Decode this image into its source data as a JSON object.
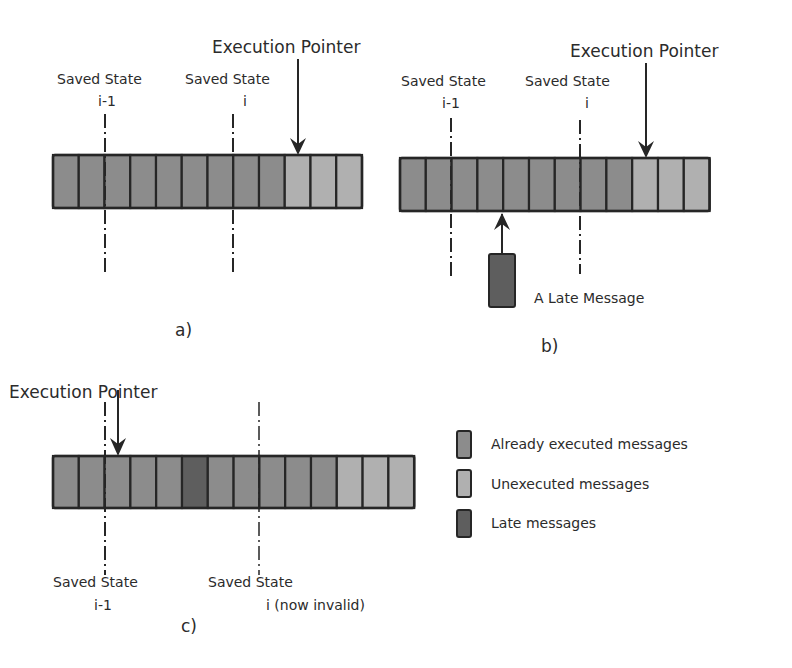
{
  "colors": {
    "executed": "#8c8c8c",
    "unexecuted": "#b0b0b0",
    "late": "#5e5e5e",
    "stroke": "#262626",
    "text": "#2b2b2b"
  },
  "panels": [
    {
      "id": "a",
      "label": "a)",
      "cells": [
        "executed",
        "executed",
        "executed",
        "executed",
        "executed",
        "executed",
        "executed",
        "executed",
        "executed",
        "unexecuted",
        "unexecuted",
        "unexecuted"
      ],
      "execution_pointer": {
        "label": "Execution Pointer",
        "at_cell_center": 9
      },
      "saved_states": [
        {
          "title": "Saved State",
          "subtitle": "i-1",
          "at_boundary": 2
        },
        {
          "title": "Saved State",
          "subtitle": "i",
          "at_boundary": 7
        }
      ]
    },
    {
      "id": "b",
      "label": "b)",
      "cells": [
        "executed",
        "executed",
        "executed",
        "executed",
        "executed",
        "executed",
        "executed",
        "executed",
        "executed",
        "unexecuted",
        "unexecuted",
        "unexecuted"
      ],
      "execution_pointer": {
        "label": "Execution Pointer",
        "at_cell_center": 9
      },
      "saved_states": [
        {
          "title": "Saved State",
          "subtitle": "i-1",
          "at_boundary": 2
        },
        {
          "title": "Saved State",
          "subtitle": "i",
          "at_boundary": 7
        }
      ],
      "late_message": {
        "label": "A Late Message",
        "inserts_at_boundary": 4
      }
    },
    {
      "id": "c",
      "label": "c)",
      "cells": [
        "executed",
        "executed",
        "executed",
        "executed",
        "executed",
        "late",
        "executed",
        "executed",
        "executed",
        "executed",
        "executed",
        "unexecuted",
        "unexecuted",
        "unexecuted"
      ],
      "execution_pointer": {
        "label": "Execution Pointer",
        "at_cell_center": 2
      },
      "saved_states": [
        {
          "title": "Saved State",
          "subtitle": "i-1",
          "at_boundary": 2
        },
        {
          "title": "Saved State",
          "subtitle": "i (now invalid)",
          "at_boundary": 8
        }
      ]
    }
  ],
  "legend": [
    {
      "key": "executed",
      "label": "Already executed messages"
    },
    {
      "key": "unexecuted",
      "label": "Unexecuted messages"
    },
    {
      "key": "late",
      "label": "Late messages"
    }
  ],
  "text": {
    "a_pointer": "Execution Pointer",
    "a_ss1_title": "Saved State",
    "a_ss1_sub": "i-1",
    "a_ss2_title": "Saved State",
    "a_ss2_sub": "i",
    "a_label": "a)",
    "b_pointer": "Execution Pointer",
    "b_ss1_title": "Saved State",
    "b_ss1_sub": "i-1",
    "b_ss2_title": "Saved State",
    "b_ss2_sub": "i",
    "b_late": "A Late Message",
    "b_label": "b)",
    "c_pointer": "Execution Pointer",
    "c_ss1_title": "Saved State",
    "c_ss1_sub": "i-1",
    "c_ss2_title": "Saved State",
    "c_ss2_sub": "i (now invalid)",
    "c_label": "c)",
    "legend_executed": "Already executed messages",
    "legend_unexecuted": "Unexecuted messages",
    "legend_late": "Late messages"
  }
}
